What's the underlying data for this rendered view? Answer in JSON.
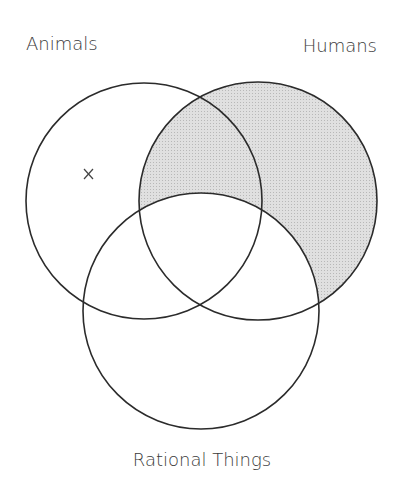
{
  "diagram": {
    "type": "venn",
    "sets": [
      {
        "id": "animals",
        "label": "Animals",
        "cx": 144,
        "cy": 201,
        "r": 118,
        "label_x": 26,
        "label_y": 50,
        "label_anchor": "start"
      },
      {
        "id": "humans",
        "label": "Humans",
        "cx": 258,
        "cy": 201,
        "r": 119,
        "label_x": 377,
        "label_y": 52,
        "label_anchor": "end"
      },
      {
        "id": "rational",
        "label": "Rational Things",
        "cx": 201,
        "cy": 311,
        "r": 118,
        "label_x": 202,
        "label_y": 466,
        "label_anchor": "middle"
      }
    ],
    "shaded_region": {
      "description": "Humans outside Rational Things",
      "fill": "#d6d6d6"
    },
    "markers": [
      {
        "symbol": "x",
        "region": "Animals only",
        "x": 88,
        "y": 174
      }
    ],
    "colors": {
      "stroke": "#2b2b2b",
      "shade": "#d6d6d6",
      "text": "#3a3a3a"
    }
  }
}
